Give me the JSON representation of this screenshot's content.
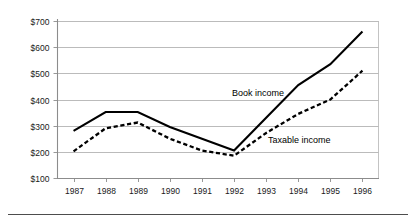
{
  "chart_data": {
    "type": "line",
    "title": "",
    "subtitle": "",
    "xlabel": "",
    "ylabel": "",
    "categories": [
      "1987",
      "1988",
      "1989",
      "1990",
      "1991",
      "1992",
      "1993",
      "1994",
      "1995",
      "1996"
    ],
    "x_tick_labels": [
      "1987",
      "1988",
      "1989",
      "1990",
      "1991",
      "1992",
      "1993",
      "1994",
      "1995",
      "1996"
    ],
    "y_tick_labels": [
      "$100",
      "$200",
      "$300",
      "$400",
      "$500",
      "$600",
      "$700"
    ],
    "y_tick_values": [
      100,
      200,
      300,
      400,
      500,
      600,
      700
    ],
    "ylim": [
      100,
      700
    ],
    "grid": true,
    "legend_position": "inline-annotation",
    "series": [
      {
        "name": "Book income",
        "style": "solid",
        "color": "#000000",
        "label_text": "Book income",
        "values": [
          280,
          352,
          352,
          295,
          250,
          205,
          330,
          455,
          535,
          660
        ]
      },
      {
        "name": "Taxable income",
        "style": "dashed",
        "color": "#000000",
        "label_text": "Taxable income",
        "values": [
          202,
          290,
          312,
          250,
          205,
          185,
          272,
          345,
          400,
          510
        ]
      }
    ],
    "annotations": [
      {
        "text": "Book income",
        "series": "Book income"
      },
      {
        "text": "Taxable income",
        "series": "Taxable income"
      }
    ]
  },
  "colors": {
    "background": "#ffffff",
    "gridline": "#a9a9a9",
    "axis": "#8c8c8c",
    "series_line": "#000000",
    "text": "#1a1a1a",
    "footer_rule": "#4d4d4d"
  }
}
